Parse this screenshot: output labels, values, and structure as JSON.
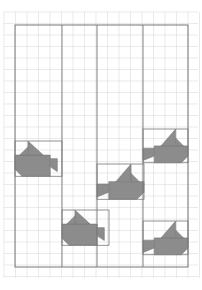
{
  "diagram": {
    "type": "quilt-layout",
    "grid": {
      "pitch": 11.5,
      "color": "#dcdcdc"
    },
    "border": {
      "x": 15,
      "y": 25,
      "w": 173,
      "h": 242,
      "color": "#777777"
    },
    "columns_x": [
      15,
      62,
      97,
      143,
      188
    ],
    "fill_color": "#8c8c8c",
    "fish": [
      {
        "x": 15,
        "y": 141,
        "w": 47,
        "dir": "left"
      },
      {
        "x": 62,
        "y": 210,
        "w": 47,
        "dir": "left"
      },
      {
        "x": 97,
        "y": 164,
        "w": 47,
        "dir": "right"
      },
      {
        "x": 143,
        "y": 129,
        "w": 45,
        "dir": "right"
      },
      {
        "x": 143,
        "y": 221,
        "w": 45,
        "dir": "right"
      }
    ]
  }
}
